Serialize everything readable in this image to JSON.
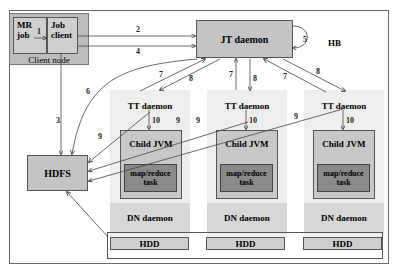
{
  "diagram": {
    "client_node": {
      "label": "Client node",
      "mr_job": "MR job",
      "job_client": "Job client"
    },
    "jt_daemon": "JT daemon",
    "heartbeat": "HB",
    "hdfs": "HDFS",
    "nodes": [
      {
        "tt": "TT daemon",
        "jvm": "Child JVM",
        "task": "map/reduce task",
        "dn": "DN daemon",
        "hdd": "HDD"
      },
      {
        "tt": "TT daemon",
        "jvm": "Child JVM",
        "task": "map/reduce task",
        "dn": "DN daemon",
        "hdd": "HDD"
      },
      {
        "tt": "TT daemon",
        "jvm": "Child JVM",
        "task": "map/reduce task",
        "dn": "DN daemon",
        "hdd": "HDD"
      }
    ],
    "edges": [
      {
        "label": "1",
        "from": "MR job",
        "to": "Job client"
      },
      {
        "label": "2",
        "from": "Job client",
        "to": "JT daemon"
      },
      {
        "label": "3",
        "from": "Job client",
        "to": "HDFS"
      },
      {
        "label": "4",
        "from": "Job client",
        "to": "JT daemon"
      },
      {
        "label": "5",
        "from": "JT daemon",
        "to": "JT daemon"
      },
      {
        "label": "6",
        "from": "JT daemon",
        "to": "HDFS"
      },
      {
        "label": "7",
        "from": "TT daemon",
        "to": "JT daemon"
      },
      {
        "label": "8",
        "from": "JT daemon",
        "to": "TT daemon"
      },
      {
        "label": "9",
        "from": "TT daemon",
        "to": "HDFS"
      },
      {
        "label": "10",
        "from": "TT daemon",
        "to": "Child JVM"
      }
    ]
  }
}
